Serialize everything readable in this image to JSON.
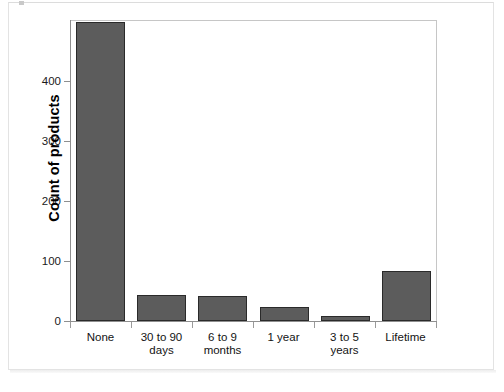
{
  "chart_data": {
    "type": "bar",
    "title": "",
    "subtitle": "",
    "xlabel": "",
    "ylabel": "Count of products",
    "categories": [
      "None",
      "30 to 90 days",
      "6 to 9 months",
      "1 year",
      "3 to 5 years",
      "Lifetime"
    ],
    "category_lines": [
      [
        "None"
      ],
      [
        "30 to 90",
        "days"
      ],
      [
        "6 to 9",
        "months"
      ],
      [
        "1 year"
      ],
      [
        "3 to 5",
        "years"
      ],
      [
        "Lifetime"
      ]
    ],
    "values": [
      475,
      42,
      40,
      23,
      8,
      80
    ],
    "ylim": [
      0,
      478
    ],
    "yticks": [
      0,
      100,
      200,
      300,
      400
    ],
    "ytick_labels": [
      "0",
      "100",
      "200",
      "300",
      "400"
    ],
    "grid": false,
    "legend": false,
    "bar_color": "#5c5c5c",
    "bar_edge_color": "#2a2a2a",
    "axis_color": "#8f8f8f",
    "plot_background": "#ffffff"
  }
}
